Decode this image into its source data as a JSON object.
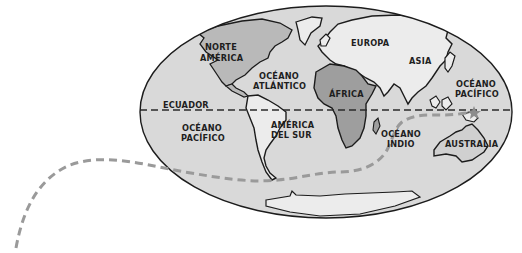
{
  "map": {
    "type": "world-map-mollweide",
    "colors": {
      "ocean": "#d9d9d9",
      "continent_light": "#ececec",
      "continent_mid": "#b9b9b9",
      "continent_dark": "#9e9e9e",
      "outline": "#1c1c1c",
      "route": "#9a9a9a",
      "equator": "#2a2a2a"
    },
    "equator_label": "ECUADOR",
    "continents": {
      "north_america": [
        "NORTE",
        "AMÉRICA"
      ],
      "south_america": [
        "AMÉRICA",
        "DEL SUR"
      ],
      "europe": "EUROPA",
      "asia": "ASIA",
      "africa": "ÁFRICA",
      "australia": "AUSTRALIA"
    },
    "oceans": {
      "atlantic": [
        "OCÉANO",
        "ATLÁNTICO"
      ],
      "pacific_west": [
        "OCÉANO",
        "PACÍFICO"
      ],
      "pacific_east": [
        "OCÉANO",
        "PACÍFICO"
      ],
      "indian": [
        "OCÉANO",
        "INDIO"
      ]
    },
    "route": {
      "description": "Dashed grey route from Indonesia through Indian Ocean, around southern Africa and Cape Horn, exiting the map to the lower left",
      "style": "dashed"
    }
  }
}
